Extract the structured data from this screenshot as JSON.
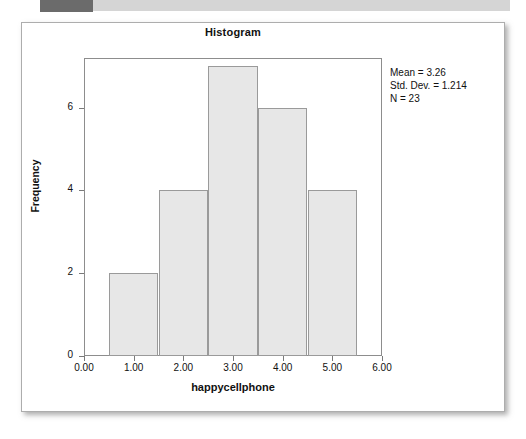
{
  "decor": {
    "top_band_label": "header-band",
    "band_dark_color": "#6b6b6b",
    "band_light_color": "#d5d5d5"
  },
  "card": {
    "border_color": "#adadad",
    "background": "#ffffff"
  },
  "stats": {
    "mean_line": "Mean = 3.26",
    "std_dev_line": "Std. Dev. = 1.214",
    "n_line": "N = 23"
  },
  "chart_data": {
    "type": "bar",
    "title": "Histogram",
    "xlabel": "happycellphone",
    "ylabel": "Frequency",
    "categories": [
      "1.00",
      "2.00",
      "3.00",
      "4.00",
      "5.00"
    ],
    "bin_edges": [
      0.5,
      1.5,
      2.5,
      3.5,
      4.5,
      5.5
    ],
    "bin_centers": [
      1,
      2,
      3,
      4,
      5
    ],
    "values": [
      2,
      4,
      7,
      6,
      4
    ],
    "xlim": [
      0,
      6
    ],
    "ylim": [
      0,
      7.2
    ],
    "x_ticks": [
      "0.00",
      "1.00",
      "2.00",
      "3.00",
      "4.00",
      "5.00",
      "6.00"
    ],
    "x_tick_values": [
      0,
      1,
      2,
      3,
      4,
      5,
      6
    ],
    "y_ticks": [
      "0",
      "2",
      "4",
      "6"
    ],
    "y_tick_values": [
      0,
      2,
      4,
      6
    ],
    "grid": false,
    "legend": false,
    "bar_fill_color": "#e7e7e7",
    "bar_border_color": "#9a9a9a",
    "annotations": [
      "Mean = 3.26",
      "Std. Dev. = 1.214",
      "N = 23"
    ]
  }
}
